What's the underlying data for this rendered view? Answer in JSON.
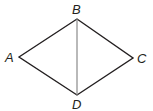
{
  "diagram": {
    "type": "quadrilateral-with-diagonal",
    "vertices": {
      "A": {
        "label": "A",
        "x": 19,
        "y": 57
      },
      "B": {
        "label": "B",
        "x": 77,
        "y": 19
      },
      "C": {
        "label": "C",
        "x": 133,
        "y": 58
      },
      "D": {
        "label": "D",
        "x": 77,
        "y": 95
      }
    },
    "edges": [
      "AB",
      "BC",
      "CD",
      "DA"
    ],
    "diagonals": [
      "BD"
    ],
    "colors": {
      "edge": "#231f20",
      "diagonal": "#8a8a8a",
      "background": "#ffffff"
    }
  }
}
